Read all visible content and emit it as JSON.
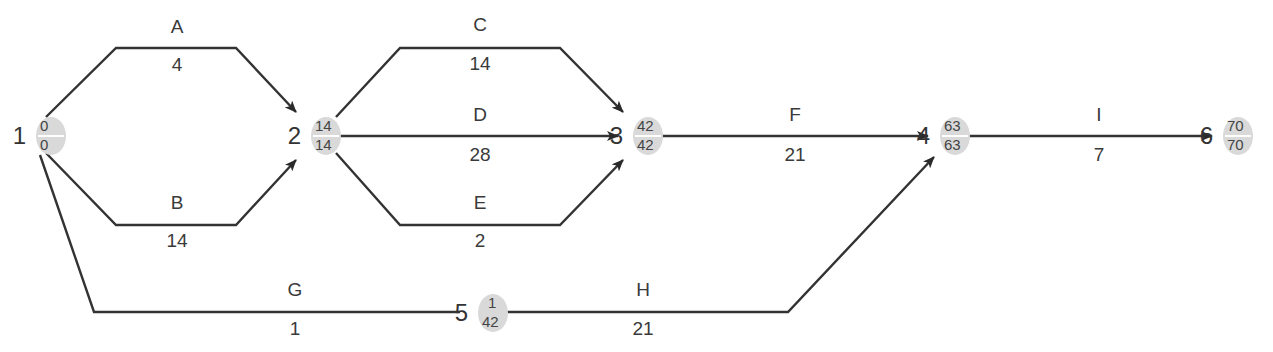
{
  "diagram": {
    "type": "activity-on-arrow network",
    "nodes": [
      {
        "id": "1",
        "early": "0",
        "late": "0"
      },
      {
        "id": "2",
        "early": "14",
        "late": "14"
      },
      {
        "id": "3",
        "early": "42",
        "late": "42"
      },
      {
        "id": "4",
        "early": "63",
        "late": "63"
      },
      {
        "id": "5",
        "early": "1",
        "late": "42"
      },
      {
        "id": "6",
        "early": "70",
        "late": "70"
      }
    ],
    "edges": [
      {
        "activity": "A",
        "duration": "4",
        "from": "1",
        "to": "2"
      },
      {
        "activity": "B",
        "duration": "14",
        "from": "1",
        "to": "2"
      },
      {
        "activity": "C",
        "duration": "14",
        "from": "2",
        "to": "3"
      },
      {
        "activity": "D",
        "duration": "28",
        "from": "2",
        "to": "3"
      },
      {
        "activity": "E",
        "duration": "2",
        "from": "2",
        "to": "3"
      },
      {
        "activity": "F",
        "duration": "21",
        "from": "3",
        "to": "4"
      },
      {
        "activity": "G",
        "duration": "1",
        "from": "1",
        "to": "5"
      },
      {
        "activity": "H",
        "duration": "21",
        "from": "5",
        "to": "4"
      },
      {
        "activity": "I",
        "duration": "7",
        "from": "4",
        "to": "6"
      }
    ]
  }
}
